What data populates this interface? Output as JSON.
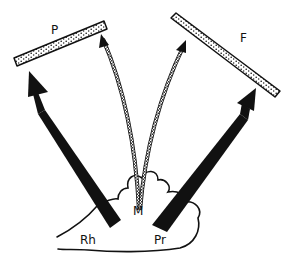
{
  "diagram": {
    "type": "anatomical-schematic",
    "colors": {
      "ink": "#111111",
      "background": "#ffffff",
      "bar_fill": "#ffffff"
    },
    "labels": {
      "p": "P",
      "f": "F",
      "m": "M",
      "rh": "Rh",
      "pr": "Pr"
    },
    "elements": [
      {
        "id": "bar-p",
        "kind": "dotted-bar",
        "label": "P"
      },
      {
        "id": "bar-f",
        "kind": "dotted-bar",
        "label": "F"
      },
      {
        "id": "arrow-rh-to-p",
        "kind": "thick-solid-arrow",
        "from": "Rh",
        "to": "P"
      },
      {
        "id": "arrow-pr-to-f",
        "kind": "thick-solid-arrow",
        "from": "Pr",
        "to": "F"
      },
      {
        "id": "arrow-m-to-p",
        "kind": "thin-hatched-curved-arrow",
        "from": "M",
        "to": "P"
      },
      {
        "id": "arrow-m-to-f",
        "kind": "thin-hatched-curved-arrow",
        "from": "M",
        "to": "F"
      },
      {
        "id": "cloud-outline",
        "kind": "outline",
        "contains": [
          "Rh",
          "M",
          "Pr"
        ]
      }
    ]
  }
}
